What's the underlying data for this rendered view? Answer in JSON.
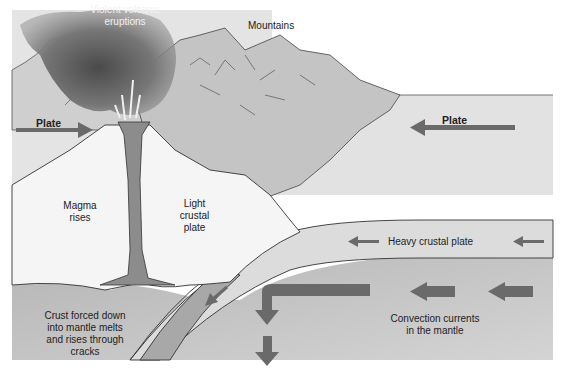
{
  "diagram": {
    "labels": {
      "eruptions": "Violent volcanic\neruptions",
      "mountains": "Mountains",
      "plate_left": "Plate",
      "plate_right": "Plate",
      "magma": "Magma\nrises",
      "light_plate": "Light\ncrustal\nplate",
      "heavy_plate": "Heavy crustal plate",
      "crust_melts": "Crust forced down\ninto mantle melts\nand rises through\ncracks",
      "convection": "Convection currents\nin the mantle"
    },
    "colors": {
      "background": "#ffffff",
      "sky": "#e6e6e6",
      "mountain": "#c8c8c8",
      "ocean": "#dedede",
      "light_plate": "#f4f4f4",
      "heavy_plate": "#e2e2e2",
      "mantle": "#bdbdbd",
      "magma": "#8a8a8a",
      "arrow": "#6a6a6a",
      "smoke": "#707070",
      "outline": "#333333"
    }
  }
}
